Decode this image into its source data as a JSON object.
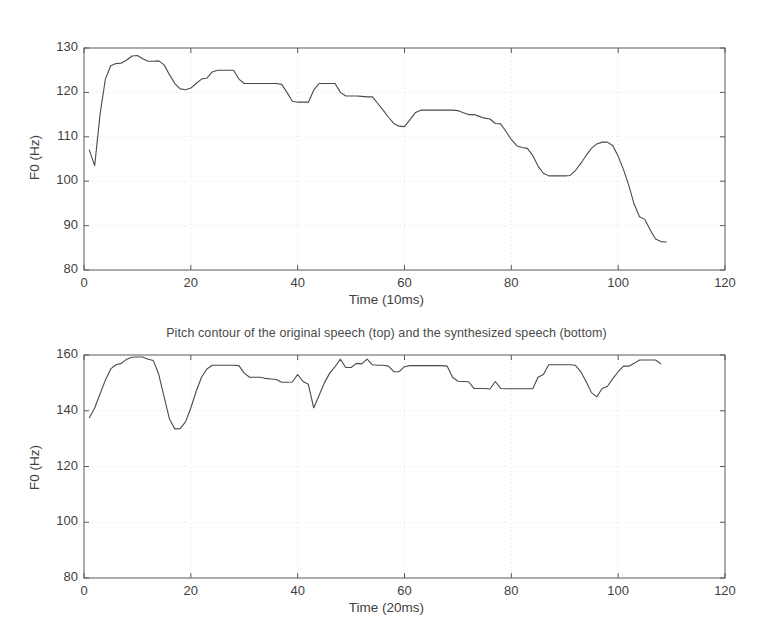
{
  "figure": {
    "title": "Pitch contour of the original speech (top) and the synthesized speech (bottom)",
    "background_color": "#ffffff",
    "line_color": "#4a4a4a",
    "axis_color": "#5a5a5a",
    "grid_color": "#dcdcdc"
  },
  "chart_data": [
    {
      "type": "line",
      "id": "original-speech-pitch",
      "title": "Pitch contour of the original speech (top) and the synthesized speech (bottom)",
      "xlabel": "Time (10ms)",
      "ylabel": "F0 (Hz)",
      "xlim": [
        0,
        120
      ],
      "ylim": [
        80,
        130
      ],
      "xticks": [
        0,
        20,
        40,
        60,
        80,
        100,
        120
      ],
      "yticks": [
        80,
        90,
        100,
        110,
        120,
        130
      ],
      "grid": true,
      "legend": null,
      "x": [
        1,
        2,
        3,
        4,
        5,
        6,
        7,
        8,
        9,
        10,
        11,
        12,
        13,
        14,
        15,
        16,
        17,
        18,
        19,
        20,
        21,
        22,
        23,
        24,
        25,
        26,
        27,
        28,
        29,
        30,
        31,
        32,
        33,
        34,
        35,
        36,
        37,
        38,
        39,
        40,
        41,
        42,
        43,
        44,
        45,
        46,
        47,
        48,
        49,
        50,
        51,
        52,
        53,
        54,
        55,
        56,
        57,
        58,
        59,
        60,
        61,
        62,
        63,
        64,
        65,
        66,
        67,
        68,
        69,
        70,
        71,
        72,
        73,
        74,
        75,
        76,
        77,
        78,
        79,
        80,
        81,
        82,
        83,
        84,
        85,
        86,
        87,
        88,
        89,
        90,
        91,
        92,
        93,
        94,
        95,
        96,
        97,
        98,
        99,
        100,
        101,
        102,
        103,
        104,
        105,
        106,
        107,
        108,
        109
      ],
      "values": [
        107.0,
        103.5,
        115.0,
        123.0,
        126.0,
        126.5,
        126.6,
        127.3,
        128.2,
        128.3,
        127.6,
        127.0,
        127.0,
        127.1,
        126.2,
        124.0,
        122.0,
        120.8,
        120.6,
        121.0,
        122.0,
        123.0,
        123.2,
        124.6,
        125.0,
        125.0,
        125.0,
        125.0,
        123.0,
        122.0,
        122.0,
        122.0,
        122.0,
        122.0,
        122.0,
        122.0,
        121.8,
        120.0,
        118.0,
        117.8,
        117.8,
        117.8,
        120.5,
        122.0,
        122.0,
        122.0,
        122.0,
        120.0,
        119.2,
        119.2,
        119.2,
        119.1,
        119.0,
        119.0,
        117.5,
        116.0,
        114.4,
        113.0,
        112.4,
        112.3,
        113.8,
        115.4,
        116.0,
        116.0,
        116.0,
        116.0,
        116.0,
        116.0,
        116.0,
        115.9,
        115.4,
        115.0,
        115.0,
        114.6,
        114.2,
        114.0,
        113.0,
        112.9,
        111.2,
        109.4,
        108.0,
        107.6,
        107.4,
        105.8,
        103.4,
        101.8,
        101.2,
        101.2,
        101.2,
        101.2,
        101.3,
        102.4,
        104.0,
        105.8,
        107.4,
        108.4,
        108.8,
        108.8,
        108.0,
        105.6,
        102.6,
        99.0,
        94.8,
        92.0,
        91.4,
        89.0,
        87.0,
        86.4,
        86.3
      ]
    },
    {
      "type": "line",
      "id": "synthesized-speech-pitch",
      "title": "",
      "xlabel": "Time (20ms)",
      "ylabel": "F0 (Hz)",
      "xlim": [
        0,
        120
      ],
      "ylim": [
        80,
        160
      ],
      "xticks": [
        0,
        20,
        40,
        60,
        80,
        100,
        120
      ],
      "yticks": [
        80,
        100,
        120,
        140,
        160
      ],
      "grid": true,
      "legend": null,
      "x": [
        1,
        2,
        3,
        4,
        5,
        6,
        7,
        8,
        9,
        10,
        11,
        12,
        13,
        14,
        15,
        16,
        17,
        18,
        19,
        20,
        21,
        22,
        23,
        24,
        25,
        26,
        27,
        28,
        29,
        30,
        31,
        32,
        33,
        34,
        35,
        36,
        37,
        38,
        39,
        40,
        41,
        42,
        43,
        44,
        45,
        46,
        47,
        48,
        49,
        50,
        51,
        52,
        53,
        54,
        55,
        56,
        57,
        58,
        59,
        60,
        61,
        62,
        63,
        64,
        65,
        66,
        67,
        68,
        69,
        70,
        71,
        72,
        73,
        74,
        75,
        76,
        77,
        78,
        79,
        80,
        81,
        82,
        83,
        84,
        85,
        86,
        87,
        88,
        89,
        90,
        91,
        92,
        93,
        94,
        95,
        96,
        97,
        98,
        99,
        100,
        101,
        102,
        103,
        104,
        105,
        106,
        107,
        108
      ],
      "values": [
        137.5,
        141.0,
        146.0,
        151.0,
        155.0,
        156.5,
        157.0,
        158.5,
        159.2,
        159.3,
        159.3,
        158.5,
        158.0,
        153.0,
        145.0,
        137.0,
        133.5,
        133.6,
        136.0,
        141.0,
        147.0,
        152.0,
        155.0,
        156.3,
        156.3,
        156.3,
        156.3,
        156.3,
        156.2,
        153.5,
        152.0,
        152.0,
        152.0,
        151.6,
        151.4,
        151.2,
        150.2,
        150.2,
        150.3,
        153.0,
        150.5,
        149.5,
        141.0,
        145.5,
        150.0,
        153.5,
        155.8,
        158.5,
        155.5,
        155.5,
        157.0,
        156.8,
        158.5,
        156.5,
        156.3,
        156.3,
        156.0,
        154.0,
        154.0,
        155.8,
        156.2,
        156.2,
        156.2,
        156.2,
        156.2,
        156.2,
        156.2,
        156.0,
        152.0,
        150.6,
        150.5,
        150.4,
        148.0,
        148.0,
        148.0,
        147.8,
        150.5,
        148.0,
        147.9,
        147.9,
        147.9,
        147.9,
        147.9,
        147.9,
        152.0,
        153.0,
        156.5,
        156.5,
        156.5,
        156.5,
        156.5,
        156.3,
        154.0,
        150.5,
        146.5,
        145.0,
        148.0,
        148.8,
        151.5,
        154.0,
        156.0,
        156.0,
        157.0,
        158.2,
        158.2,
        158.2,
        158.2,
        156.8
      ]
    }
  ],
  "panels": {
    "top": {
      "xlabel": "Time (10ms)",
      "ylabel": "F0 (Hz)",
      "yticks": [
        "80",
        "90",
        "100",
        "110",
        "120",
        "130"
      ],
      "xticks": [
        "0",
        "20",
        "40",
        "60",
        "80",
        "100",
        "120"
      ]
    },
    "bottom": {
      "xlabel": "Time (20ms)",
      "ylabel": "F0 (Hz)",
      "yticks": [
        "80",
        "100",
        "120",
        "140",
        "160"
      ],
      "xticks": [
        "0",
        "20",
        "40",
        "60",
        "80",
        "100",
        "120"
      ]
    }
  }
}
